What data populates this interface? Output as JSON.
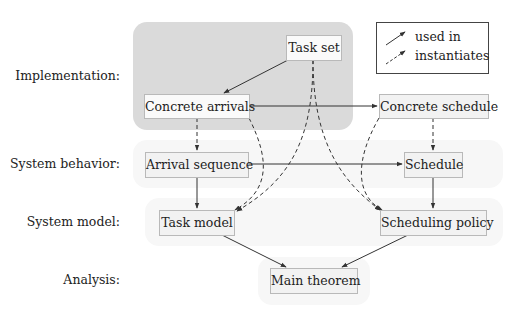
{
  "diagram": {
    "rows": [
      {
        "label": "Implementation:"
      },
      {
        "label": "System behavior:"
      },
      {
        "label": "System model:"
      },
      {
        "label": "Analysis:"
      }
    ],
    "nodes": {
      "task_set": "Task set",
      "concrete_arrivals": "Concrete arrivals",
      "concrete_schedule": "Concrete schedule",
      "arrival_sequence": "Arrival sequence",
      "schedule": "Schedule",
      "task_model": "Task model",
      "scheduling_policy": "Scheduling policy",
      "main_theorem": "Main theorem"
    },
    "legend": {
      "used_in": "used in",
      "instantiates": "instantiates"
    },
    "edges": [
      {
        "from": "Task set",
        "to": "Concrete arrivals",
        "type": "used in"
      },
      {
        "from": "Concrete arrivals",
        "to": "Concrete schedule",
        "type": "used in"
      },
      {
        "from": "Arrival sequence",
        "to": "Schedule",
        "type": "used in"
      },
      {
        "from": "Arrival sequence",
        "to": "Task model",
        "type": "used in"
      },
      {
        "from": "Schedule",
        "to": "Scheduling policy",
        "type": "used in"
      },
      {
        "from": "Task model",
        "to": "Main theorem",
        "type": "used in"
      },
      {
        "from": "Scheduling policy",
        "to": "Main theorem",
        "type": "used in"
      },
      {
        "from": "Concrete arrivals",
        "to": "Arrival sequence",
        "type": "instantiates"
      },
      {
        "from": "Concrete schedule",
        "to": "Schedule",
        "type": "instantiates"
      },
      {
        "from": "Concrete arrivals",
        "to": "Task model",
        "type": "instantiates"
      },
      {
        "from": "Task set",
        "to": "Task model",
        "type": "instantiates"
      },
      {
        "from": "Task set",
        "to": "Scheduling policy",
        "type": "instantiates"
      },
      {
        "from": "Concrete schedule",
        "to": "Scheduling policy",
        "type": "instantiates"
      }
    ],
    "colors": {
      "panel": "#dadada",
      "band": "#f7f7f7",
      "node_fill": "#f2f2f2",
      "node_border": "#b9b9b9",
      "edge": "#333333"
    }
  }
}
